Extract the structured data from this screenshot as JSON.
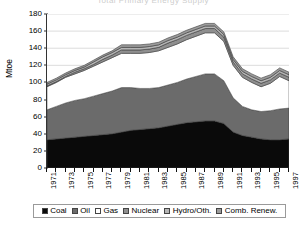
{
  "figure": {
    "clipped_title": "Total Primary Energy Supply",
    "yaxis_title": "Mtoe"
  },
  "legend": {
    "position": "bottom",
    "items": [
      {
        "label": "Coal",
        "swatch": "#0a0a0a",
        "name": "legend-swatch-coal"
      },
      {
        "label": "Oil",
        "swatch": "#6b6b6b",
        "name": "legend-swatch-oil"
      },
      {
        "label": "Gas",
        "swatch": "#ffffff",
        "name": "legend-swatch-gas"
      },
      {
        "label": "Nuclear",
        "swatch": "#8f8f8f",
        "name": "legend-swatch-nuclear"
      },
      {
        "label": "Hydro/Oth.",
        "swatch": "#b5b5b5",
        "name": "legend-swatch-hydro"
      },
      {
        "label": "Comb. Renew.",
        "swatch": "#9c9c9c",
        "name": "legend-swatch-comb-renew"
      }
    ]
  },
  "chart_data": {
    "type": "area",
    "stacked": true,
    "title": "Total Primary Energy Supply",
    "xlabel": "",
    "ylabel": "Mtoe",
    "ylim": [
      0,
      180
    ],
    "ytick_step": 20,
    "yticks": [
      0,
      20,
      40,
      60,
      80,
      100,
      120,
      140,
      160,
      180
    ],
    "grid": true,
    "xlim": [
      1971,
      1997
    ],
    "x": [
      1971,
      1972,
      1973,
      1974,
      1975,
      1976,
      1977,
      1978,
      1979,
      1980,
      1981,
      1982,
      1983,
      1984,
      1985,
      1986,
      1987,
      1988,
      1989,
      1990,
      1991,
      1992,
      1993,
      1994,
      1995,
      1996,
      1997
    ],
    "xtick_labels": [
      "1971",
      "1973",
      "1975",
      "1977",
      "1979",
      "1981",
      "1983",
      "1985",
      "1987",
      "1989",
      "1991",
      "1993",
      "1995",
      "1997"
    ],
    "series": [
      {
        "name": "Coal",
        "values": [
          33,
          34,
          35,
          36,
          37,
          38,
          39,
          40,
          42,
          44,
          45,
          46,
          47,
          49,
          51,
          53,
          54,
          55,
          55,
          52,
          42,
          38,
          36,
          34,
          33,
          33,
          34
        ]
      },
      {
        "name": "Oil",
        "values": [
          35,
          38,
          41,
          43,
          44,
          46,
          48,
          50,
          52,
          50,
          48,
          47,
          47,
          48,
          49,
          51,
          53,
          55,
          55,
          50,
          40,
          34,
          32,
          32,
          34,
          36,
          36
        ]
      },
      {
        "name": "Gas",
        "values": [
          27,
          28,
          30,
          31,
          33,
          35,
          37,
          39,
          40,
          40,
          41,
          42,
          43,
          44,
          45,
          46,
          47,
          48,
          48,
          46,
          38,
          34,
          32,
          29,
          32,
          38,
          32
        ]
      },
      {
        "name": "Nuclear",
        "values": [
          1,
          1,
          1,
          2,
          2,
          2,
          3,
          3,
          4,
          4,
          4,
          4,
          4,
          5,
          5,
          5,
          5,
          5,
          5,
          5,
          4,
          4,
          4,
          4,
          4,
          4,
          4
        ]
      },
      {
        "name": "Hydro/Oth.",
        "values": [
          2,
          2,
          2,
          2,
          2,
          3,
          3,
          3,
          3,
          3,
          3,
          3,
          3,
          3,
          3,
          3,
          3,
          3,
          3,
          3,
          3,
          3,
          3,
          3,
          3,
          3,
          3
        ]
      },
      {
        "name": "Comb. Renew.",
        "values": [
          2,
          2,
          2,
          2,
          2,
          2,
          2,
          2,
          3,
          3,
          3,
          3,
          3,
          3,
          3,
          3,
          3,
          3,
          3,
          3,
          3,
          3,
          3,
          3,
          3,
          3,
          3
        ]
      }
    ],
    "totals": [
      100,
      105,
      111,
      116,
      120,
      126,
      132,
      137,
      144,
      144,
      144,
      145,
      147,
      152,
      156,
      161,
      165,
      169,
      169,
      159,
      130,
      116,
      110,
      105,
      109,
      117,
      112
    ]
  }
}
